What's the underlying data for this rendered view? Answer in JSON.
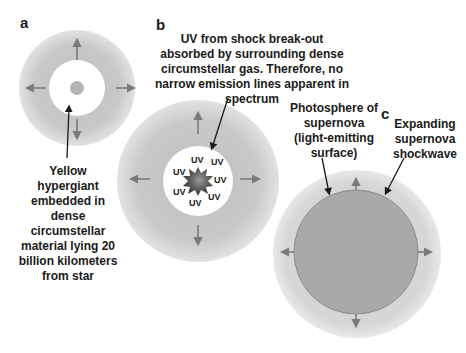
{
  "panels": {
    "a": {
      "letter": "a",
      "caption": "Yellow\nhypergiant\nembedded in\ndense\ncircumstellar\nmaterial lying 20\nbillion kilometers\nfrom star"
    },
    "b": {
      "letter": "b",
      "caption": "UV from shock break-out\nabsorbed by surrounding dense\ncircumstellar gas. Therefore, no\nnarrow emission lines apparent in\nspectrum",
      "uv_labels": [
        "UV",
        "UV",
        "UV",
        "UV",
        "UV",
        "UV",
        "UV"
      ]
    },
    "c": {
      "letter": "c",
      "photosphere_caption": "Photosphere of\nsupernova\n(light-emitting\nsurface)",
      "shockwave_caption": "Expanding\nsupernova\nshockwave"
    }
  },
  "colors": {
    "halo": "#c8c8c8",
    "halo_edge": "#e4e4e4",
    "photosphere": "#a9a9a9",
    "arrow": "#7a7a7a",
    "pointer": "#1a1a1a",
    "star_core": "#555555"
  }
}
